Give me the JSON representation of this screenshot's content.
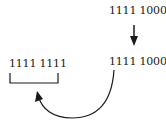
{
  "diagram": {
    "top_value": "1111 1000",
    "result_value": "1111 1000",
    "left_value": "1111 1111",
    "colors": {
      "ink": "#1a1a1a",
      "background": "#ffffff"
    }
  }
}
